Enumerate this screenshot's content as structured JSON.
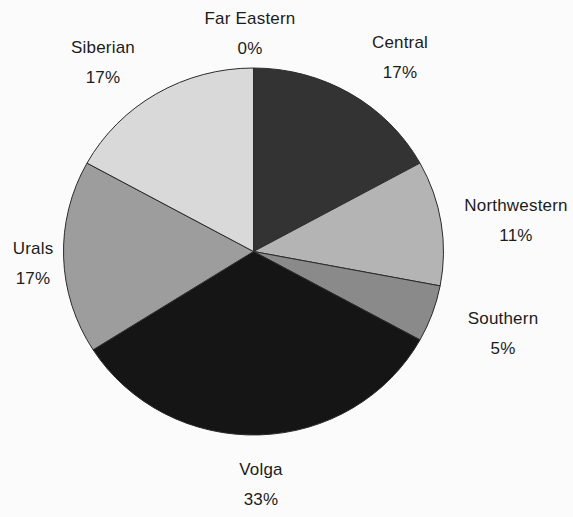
{
  "figure": {
    "background": "#fbfbfb",
    "text_color": "#1c1c1c",
    "slice_stroke": "#2b2b2b"
  },
  "chart_data": {
    "type": "pie",
    "title": "",
    "categories": [
      "Central",
      "Northwestern",
      "Southern",
      "Volga",
      "Urals",
      "Siberian",
      "Far Eastern"
    ],
    "values": [
      17,
      11,
      5,
      33,
      17,
      17,
      0
    ],
    "unit": "%",
    "direction": "clockwise",
    "start_angle_deg": 0,
    "colors": [
      "#333333",
      "#b4b4b4",
      "#8a8a8a",
      "#151515",
      "#9d9d9d",
      "#d9d9d9",
      "#d9d9d9"
    ],
    "legend": "none",
    "labels_outside": true
  },
  "labels": [
    {
      "name": "Central",
      "pct": "17%"
    },
    {
      "name": "Northwestern",
      "pct": "11%"
    },
    {
      "name": "Southern",
      "pct": "5%"
    },
    {
      "name": "Volga",
      "pct": "33%"
    },
    {
      "name": "Urals",
      "pct": "17%"
    },
    {
      "name": "Siberian",
      "pct": "17%"
    },
    {
      "name": "Far Eastern",
      "pct": "0%"
    }
  ]
}
